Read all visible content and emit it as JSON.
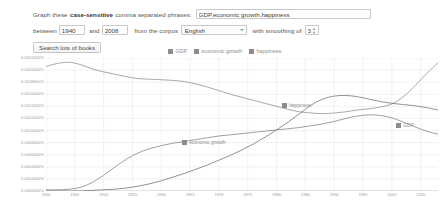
{
  "form": {
    "prompt_prefix": "Graph these",
    "prompt_bold": "case-sensitive",
    "prompt_suffix": "comma separated phrases:",
    "phrases_value": "GDP,economic growth,happiness",
    "phrases_placeholder": "",
    "between_label": "between",
    "year_start": "1940",
    "and_label": "and",
    "year_end": "2008",
    "corpus_label": "from the corpus",
    "corpus_value": "English",
    "corpus_options": [
      "English"
    ],
    "smoothing_label": "with smoothing of",
    "smoothing_value": "3",
    "smoothing_options": [
      "3"
    ],
    "search_button": "Search lots of books"
  },
  "legend": [
    {
      "label": "GDP",
      "color": "#8c8c8c"
    },
    {
      "label": "economic growth",
      "color": "#8c8c8c"
    },
    {
      "label": "happiness",
      "color": "#8c8c8c"
    }
  ],
  "inline_labels": [
    {
      "name": "happiness",
      "label": "happiness",
      "color": "#8c8c8c",
      "left": 236,
      "top": 45
    },
    {
      "name": "economic-growth",
      "label": "economic growth",
      "color": "#8c8c8c",
      "left": 136,
      "top": 82
    },
    {
      "name": "gdp",
      "label": "GDP",
      "color": "#8c8c8c",
      "left": 350,
      "top": 65
    }
  ],
  "chart_data": {
    "type": "line",
    "title": "",
    "xlabel": "",
    "ylabel": "",
    "xlim": [
      1940,
      2008
    ],
    "ylim": [
      0.0,
      0.0022
    ],
    "grid": true,
    "legend_position": "top",
    "xticks": [
      1940,
      1945,
      1950,
      1955,
      1960,
      1965,
      1970,
      1975,
      1980,
      1985,
      1990,
      1995,
      2000,
      2005
    ],
    "xticklabels": [
      "1940",
      "1945",
      "1950",
      "1955",
      "1960",
      "1965",
      "1970",
      "1975",
      "1980",
      "1985",
      "1990",
      "1995",
      "2000",
      "2005"
    ],
    "yticks": [
      0.0022,
      0.002,
      0.0018,
      0.0016,
      0.0014,
      0.0012,
      0.001,
      0.0008,
      0.0006,
      0.0004,
      0.0002,
      0.0
    ],
    "yticklabels": [
      "0.0022000%",
      "0.0020000%",
      "0.0018000%",
      "0.0016000%",
      "0.0014000%",
      "0.0012000%",
      "0.0010000%",
      "0.0008000%",
      "0.0006000%",
      "0.0004000%",
      "0.0002000%",
      "0.0000000%"
    ],
    "x": [
      1940,
      1942,
      1944,
      1946,
      1948,
      1950,
      1952,
      1954,
      1956,
      1958,
      1960,
      1962,
      1964,
      1966,
      1968,
      1970,
      1972,
      1974,
      1976,
      1978,
      1980,
      1982,
      1984,
      1986,
      1988,
      1990,
      1992,
      1994,
      1996,
      1998,
      2000,
      2002,
      2004,
      2006,
      2008
    ],
    "series": [
      {
        "name": "happiness",
        "color": "#8c8c8c",
        "values": [
          0.00206,
          0.00211,
          0.00213,
          0.00209,
          0.00202,
          0.00197,
          0.00193,
          0.00189,
          0.00186,
          0.00185,
          0.00184,
          0.00183,
          0.00181,
          0.00177,
          0.00172,
          0.00166,
          0.0016,
          0.00155,
          0.0015,
          0.00145,
          0.0014,
          0.00135,
          0.00131,
          0.00129,
          0.00128,
          0.00129,
          0.00131,
          0.00134,
          0.00136,
          0.00139,
          0.00144,
          0.00156,
          0.00174,
          0.00194,
          0.00212
        ]
      },
      {
        "name": "economic growth",
        "color": "#7f7f7f",
        "values": [
          2e-05,
          2e-05,
          3e-05,
          6e-05,
          0.00014,
          0.00026,
          0.0004,
          0.00053,
          0.00063,
          0.0007,
          0.00075,
          0.00079,
          0.00082,
          0.00085,
          0.00088,
          0.00091,
          0.00093,
          0.00095,
          0.00097,
          0.00099,
          0.00101,
          0.00103,
          0.00105,
          0.00108,
          0.00111,
          0.00115,
          0.0012,
          0.00124,
          0.00126,
          0.00125,
          0.00121,
          0.00114,
          0.00106,
          0.00099,
          0.00094
        ]
      },
      {
        "name": "GDP",
        "color": "#6e6e6e",
        "values": [
          0.0,
          0.0,
          0.0,
          0.0,
          1e-05,
          2e-05,
          3e-05,
          5e-05,
          8e-05,
          0.00012,
          0.00017,
          0.00023,
          0.00029,
          0.00036,
          0.00043,
          0.00051,
          0.00059,
          0.00068,
          0.00078,
          0.00089,
          0.00101,
          0.00114,
          0.00128,
          0.00142,
          0.00152,
          0.00157,
          0.00158,
          0.00156,
          0.00152,
          0.00148,
          0.00145,
          0.00143,
          0.00141,
          0.00138,
          0.00134
        ]
      }
    ]
  }
}
